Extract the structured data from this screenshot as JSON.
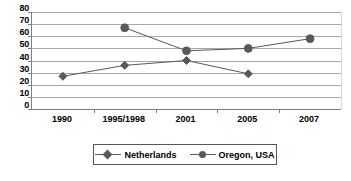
{
  "chart_data": {
    "type": "line",
    "title": "",
    "xlabel": "",
    "ylabel": "",
    "categories": [
      "1990",
      "1995/1998",
      "2001",
      "2005",
      "2007"
    ],
    "ylim": [
      0,
      80
    ],
    "yticks": [
      0,
      10,
      20,
      30,
      40,
      50,
      60,
      70,
      80
    ],
    "grid": true,
    "legend_position": "bottom",
    "series": [
      {
        "name": "Netherlands",
        "marker": "diamond",
        "color": "#595959",
        "values": [
          27,
          36,
          40,
          29,
          null
        ]
      },
      {
        "name": "Oregon, USA",
        "marker": "circle",
        "color": "#595959",
        "values": [
          null,
          67,
          48,
          50,
          58
        ]
      }
    ]
  },
  "legend": {
    "items": [
      {
        "label": "Netherlands",
        "marker": "diamond-marker-icon"
      },
      {
        "label": "Oregon, USA",
        "marker": "circle-marker-icon"
      }
    ]
  },
  "caption": {
    "sliver_text": ""
  }
}
